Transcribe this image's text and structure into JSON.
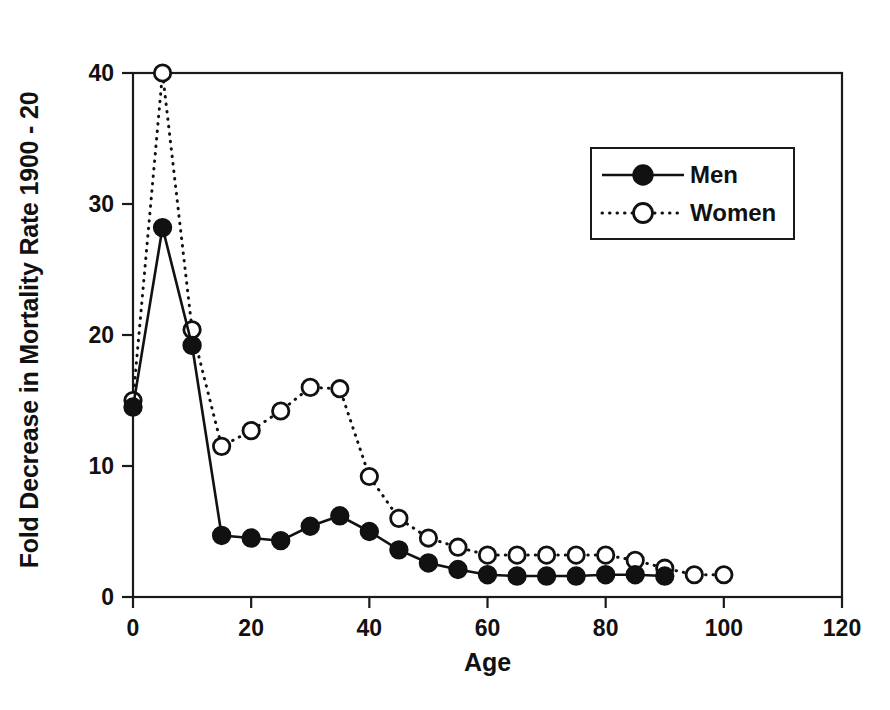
{
  "chart_data": {
    "type": "line",
    "title": "",
    "xlabel": "Age",
    "ylabel": "Fold Decrease in Mortality Rate 1900 - 20",
    "xlim": [
      0,
      120
    ],
    "ylim": [
      0,
      40
    ],
    "xticks": [
      0,
      20,
      40,
      60,
      80,
      100,
      120
    ],
    "yticks": [
      0,
      10,
      20,
      30,
      40
    ],
    "xtick_labels": [
      "0",
      "20",
      "40",
      "60",
      "80",
      "100",
      "120"
    ],
    "ytick_labels": [
      "0",
      "10",
      "20",
      "30",
      "40"
    ],
    "grid": false,
    "legend_position": "upper-right-inside",
    "series": [
      {
        "name": "Men",
        "marker": "filled-circle",
        "linestyle": "solid",
        "color": "#111111",
        "x": [
          0,
          5,
          10,
          15,
          20,
          25,
          30,
          35,
          40,
          45,
          50,
          55,
          60,
          65,
          70,
          75,
          80,
          85,
          90
        ],
        "values": [
          14.5,
          28.2,
          19.2,
          4.7,
          4.5,
          4.3,
          5.4,
          6.2,
          5.0,
          3.6,
          2.6,
          2.1,
          1.7,
          1.6,
          1.6,
          1.6,
          1.7,
          1.7,
          1.6
        ]
      },
      {
        "name": "Women",
        "marker": "open-circle",
        "linestyle": "dotted",
        "color": "#111111",
        "x": [
          0,
          5,
          10,
          15,
          20,
          25,
          30,
          35,
          40,
          45,
          50,
          55,
          60,
          65,
          70,
          75,
          80,
          85,
          90,
          95,
          100
        ],
        "values": [
          15.0,
          40.0,
          20.4,
          11.5,
          12.7,
          14.2,
          16.0,
          15.9,
          9.2,
          6.0,
          4.5,
          3.8,
          3.2,
          3.2,
          3.2,
          3.2,
          3.2,
          2.8,
          2.2,
          1.7,
          1.7
        ]
      }
    ]
  },
  "axes": {
    "y_title": "Fold Decrease in Mortality Rate 1900 - 20",
    "x_title": "Age"
  },
  "legend": {
    "entries": [
      {
        "label": "Men"
      },
      {
        "label": "Women"
      }
    ]
  },
  "scan": {
    "caption_fragment": " "
  }
}
